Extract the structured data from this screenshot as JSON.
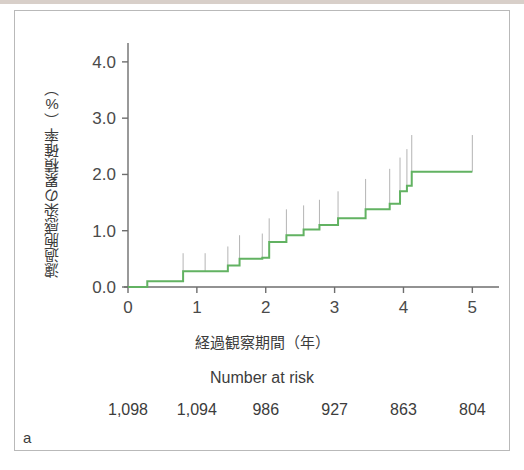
{
  "panel": {
    "letter": "a"
  },
  "chart_data": {
    "type": "line",
    "subtype": "kaplan-meier-cumulative-incidence-step",
    "title": "",
    "xlabel": "経過観察期間（年）",
    "ylabel": "濾過胞感染の累積確率（%）",
    "xlim": [
      0,
      5.3
    ],
    "ylim": [
      0,
      4.3
    ],
    "xticks": [
      0,
      1,
      2,
      3,
      4,
      5
    ],
    "xticklabels": [
      "0",
      "1",
      "2",
      "3",
      "4",
      "5"
    ],
    "yticks": [
      0.0,
      1.0,
      2.0,
      3.0,
      4.0
    ],
    "yticklabels": [
      "0.0",
      "1.0",
      "2.0",
      "3.0",
      "4.0"
    ],
    "grid": false,
    "legend": false,
    "series": [
      {
        "name": "濾過胞感染の累積確率",
        "color": "#62b262",
        "line_width": 2,
        "step": "post",
        "x": [
          0.0,
          0.28,
          0.7,
          0.8,
          1.12,
          1.45,
          1.62,
          1.95,
          2.05,
          2.3,
          2.55,
          2.78,
          3.05,
          3.45,
          3.8,
          3.95,
          4.05,
          4.12,
          5.0
        ],
        "y": [
          0.0,
          0.1,
          0.1,
          0.28,
          0.28,
          0.38,
          0.5,
          0.52,
          0.8,
          0.92,
          1.02,
          1.1,
          1.22,
          1.38,
          1.48,
          1.7,
          1.8,
          2.05,
          2.05
        ]
      }
    ],
    "confidence_ticks": {
      "color": "#b4b4b4",
      "description": "thin vertical censor/confidence marks rising above each step",
      "marks": [
        {
          "x": 0.8,
          "y_bottom": 0.28,
          "y_top": 0.6
        },
        {
          "x": 1.12,
          "y_bottom": 0.28,
          "y_top": 0.6
        },
        {
          "x": 1.45,
          "y_bottom": 0.38,
          "y_top": 0.72
        },
        {
          "x": 1.62,
          "y_bottom": 0.5,
          "y_top": 0.92
        },
        {
          "x": 1.95,
          "y_bottom": 0.52,
          "y_top": 0.95
        },
        {
          "x": 2.05,
          "y_bottom": 0.8,
          "y_top": 1.22
        },
        {
          "x": 2.3,
          "y_bottom": 0.92,
          "y_top": 1.38
        },
        {
          "x": 2.55,
          "y_bottom": 1.02,
          "y_top": 1.45
        },
        {
          "x": 2.78,
          "y_bottom": 1.1,
          "y_top": 1.55
        },
        {
          "x": 3.05,
          "y_bottom": 1.22,
          "y_top": 1.7
        },
        {
          "x": 3.45,
          "y_bottom": 1.38,
          "y_top": 1.92
        },
        {
          "x": 3.8,
          "y_bottom": 1.48,
          "y_top": 2.1
        },
        {
          "x": 3.95,
          "y_bottom": 1.7,
          "y_top": 2.3
        },
        {
          "x": 4.05,
          "y_bottom": 1.8,
          "y_top": 2.45
        },
        {
          "x": 4.12,
          "y_bottom": 2.05,
          "y_top": 2.7
        },
        {
          "x": 5.0,
          "y_bottom": 2.05,
          "y_top": 2.7
        }
      ]
    },
    "number_at_risk": {
      "title": "Number at risk",
      "x_positions": [
        0,
        1,
        2,
        3,
        4,
        5
      ],
      "values": [
        "1,098",
        "1,094",
        "986",
        "927",
        "863",
        "804"
      ]
    }
  },
  "colors": {
    "curve": "#62b262",
    "axis": "#6e6e6e",
    "text": "#3c3c3c",
    "confidence": "#b4b4b4",
    "border": "#b9b9b9"
  }
}
